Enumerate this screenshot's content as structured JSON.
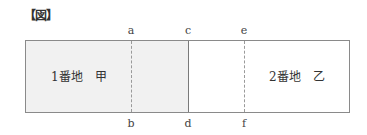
{
  "figure": {
    "caption": "【図】",
    "points_top": [
      "a",
      "c",
      "e"
    ],
    "points_bottom": [
      "b",
      "d",
      "f"
    ],
    "lines": [
      {
        "from": "a",
        "to": "b",
        "style": "dashed"
      },
      {
        "from": "c",
        "to": "d",
        "style": "solid"
      },
      {
        "from": "e",
        "to": "f",
        "style": "dashed"
      }
    ],
    "parcels": [
      {
        "label": "1番地　甲",
        "shaded": true
      },
      {
        "label": "2番地　乙",
        "shaded": false
      }
    ],
    "colors": {
      "shade": "#f1f1f1",
      "border": "#8a8a8a"
    }
  }
}
